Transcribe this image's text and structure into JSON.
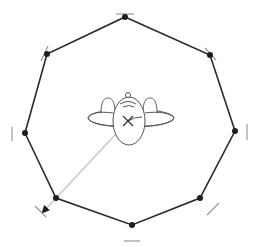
{
  "diagram": {
    "type": "octagon-holding-pattern",
    "colors": {
      "track": "#2a2a2a",
      "vertex": "#1e1e1e",
      "tick": "#9a9a9a",
      "heading_line": "#c4c4c4",
      "aircraft": "#555555",
      "background": "#ffffff"
    },
    "vertices": [
      {
        "id": "top",
        "x": 125,
        "y": 17
      },
      {
        "id": "upper-right",
        "x": 210,
        "y": 55
      },
      {
        "id": "right",
        "x": 235,
        "y": 131
      },
      {
        "id": "lower-right",
        "x": 200,
        "y": 198
      },
      {
        "id": "bottom",
        "x": 132,
        "y": 225
      },
      {
        "id": "lower-left",
        "x": 56,
        "y": 198
      },
      {
        "id": "left",
        "x": 25,
        "y": 133
      },
      {
        "id": "upper-left",
        "x": 47,
        "y": 54
      }
    ],
    "ticks": [
      {
        "id": "top",
        "x1": 116,
        "y1": 14,
        "x2": 134,
        "y2": 14
      },
      {
        "id": "upper-right",
        "x1": 205,
        "y1": 48,
        "x2": 216,
        "y2": 60
      },
      {
        "id": "right",
        "x1": 247,
        "y1": 124,
        "x2": 247,
        "y2": 140
      },
      {
        "id": "lower-right",
        "x1": 207,
        "y1": 215,
        "x2": 219,
        "y2": 203
      },
      {
        "id": "bottom",
        "x1": 124,
        "y1": 241,
        "x2": 140,
        "y2": 241
      },
      {
        "id": "lower-left",
        "x1": 35,
        "y1": 206,
        "x2": 46,
        "y2": 217
      },
      {
        "id": "left",
        "x1": 12,
        "y1": 127,
        "x2": 12,
        "y2": 141
      },
      {
        "id": "upper-left",
        "x1": 41,
        "y1": 61,
        "x2": 48,
        "y2": 46
      }
    ],
    "aircraft": {
      "center_x": 128,
      "center_y": 121,
      "marker": "x-marker"
    },
    "heading_line": {
      "x1": 128,
      "y1": 121,
      "x2": 43,
      "y2": 212
    }
  }
}
